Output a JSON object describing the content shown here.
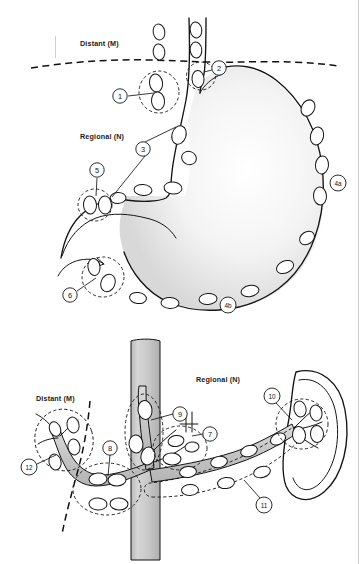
{
  "figure": {
    "panels": [
      {
        "id": "upper",
        "name": "stomach-lymph-node-panel",
        "region_labels": [
          {
            "id": "distant-m-upper",
            "text": "Distant (M)",
            "x": 80,
            "y": 46
          },
          {
            "id": "regional-n-upper",
            "text": "Regional (N)",
            "x": 80,
            "y": 139
          }
        ],
        "markers": [
          {
            "id": "1",
            "label": "1",
            "cx": 120,
            "cy": 96,
            "r": 7.2
          },
          {
            "id": "2",
            "label": "2",
            "cx": 219,
            "cy": 68,
            "r": 7.2
          },
          {
            "id": "3",
            "label": "3",
            "cx": 143,
            "cy": 149,
            "r": 7.2
          },
          {
            "id": "4a",
            "label": "4a",
            "cx": 338,
            "cy": 183,
            "r": 8.0
          },
          {
            "id": "4b",
            "label": "4b",
            "cx": 228,
            "cy": 305,
            "r": 8.0
          },
          {
            "id": "5",
            "label": "5",
            "cx": 97,
            "cy": 170,
            "r": 7.2
          },
          {
            "id": "6",
            "label": "6",
            "cx": 70,
            "cy": 295,
            "r": 7.2
          }
        ]
      },
      {
        "id": "lower",
        "name": "vascular-splenic-hilum-panel",
        "region_labels": [
          {
            "id": "distant-m-lower",
            "text": "Distant (M)",
            "x": 60,
            "y": 401
          },
          {
            "id": "regional-n-lower",
            "text": "Regional (N)",
            "x": 228,
            "y": 382
          }
        ],
        "markers": [
          {
            "id": "7",
            "label": "7",
            "cx": 210,
            "cy": 434,
            "r": 7.2
          },
          {
            "id": "8",
            "label": "8",
            "cx": 110,
            "cy": 448,
            "r": 7.2
          },
          {
            "id": "9",
            "label": "9",
            "cx": 180,
            "cy": 414,
            "r": 7.2
          },
          {
            "id": "10",
            "label": "10",
            "cx": 272,
            "cy": 396,
            "r": 8.0
          },
          {
            "id": "11",
            "label": "11",
            "cx": 264,
            "cy": 505,
            "r": 8.0
          },
          {
            "id": "12",
            "label": "12",
            "cx": 29,
            "cy": 467,
            "r": 8.0
          }
        ]
      }
    ],
    "colors": {
      "ink": "#141414",
      "paper": "#ffffff",
      "organ_shade": "#ededed",
      "vessel_shade": "#c9c9c9",
      "column_shade": "#c6c6c6"
    }
  }
}
